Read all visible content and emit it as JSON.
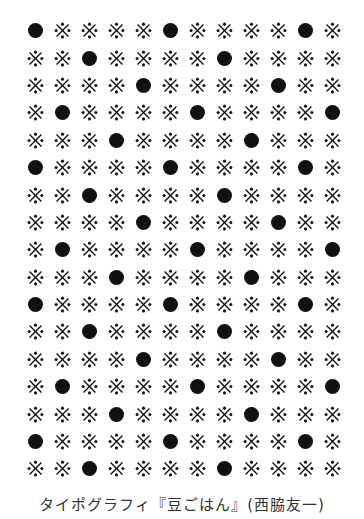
{
  "figure": {
    "rows": 17,
    "columns": 12,
    "glyphs": {
      "dot": "●",
      "mark": "※"
    },
    "dot_positions": [
      [
        1,
        6,
        11
      ],
      [
        3,
        8
      ],
      [
        5,
        10
      ],
      [
        2,
        7,
        12
      ],
      [
        4,
        9
      ],
      [
        1,
        6,
        11
      ],
      [
        3,
        8
      ],
      [
        5,
        10
      ],
      [
        2,
        7,
        12
      ],
      [
        4,
        9
      ],
      [
        1,
        6,
        11
      ],
      [
        3,
        8
      ],
      [
        5,
        10
      ],
      [
        2,
        7,
        12
      ],
      [
        4,
        9
      ],
      [
        1,
        6,
        11
      ],
      [
        3,
        8
      ]
    ],
    "colors": {
      "ink": "#111111",
      "background": "#ffffff",
      "caption": "#333333"
    }
  },
  "caption": "タイポグラフィ『豆ごはん』(西脇友一)"
}
